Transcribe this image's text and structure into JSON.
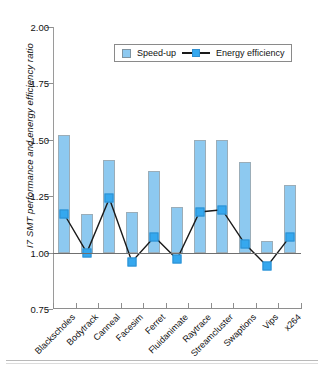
{
  "chart_data": {
    "type": "bar",
    "title": "",
    "xlabel": "",
    "ylabel": "I7 SMT performance and energy efficiency ratio",
    "ylim": [
      0.75,
      2.0
    ],
    "ytick_labels": [
      "2.00",
      "1.75",
      "1.50",
      "1.25",
      "1.00",
      "0.75"
    ],
    "ytick_values": [
      2.0,
      1.75,
      1.5,
      1.25,
      1.0,
      0.75
    ],
    "baseline": 1.0,
    "grid": false,
    "legend_position": "top-center",
    "categories": [
      "Blackscholes",
      "Bodytrack",
      "Canneal",
      "Facesim",
      "Ferret",
      "Fluidanimate",
      "Raytrace",
      "Streamcluster",
      "Swaptions",
      "Vips",
      "x264"
    ],
    "series": [
      {
        "name": "Speed-up",
        "type": "bar",
        "color": "#8dc9f0",
        "values": [
          1.52,
          1.17,
          1.41,
          1.18,
          1.36,
          1.2,
          1.5,
          1.5,
          1.4,
          1.05,
          1.3
        ]
      },
      {
        "name": "Energy efficiency",
        "type": "line",
        "color": "#35a8ef",
        "line_color": "#1a1a1a",
        "values": [
          1.17,
          1.0,
          1.24,
          0.96,
          1.07,
          0.97,
          1.18,
          1.19,
          1.04,
          0.94,
          1.07
        ]
      }
    ]
  },
  "legend": {
    "items": [
      {
        "label": "Speed-up",
        "marker": "bar-swatch"
      },
      {
        "label": "Energy efficiency",
        "marker": "line-square"
      }
    ]
  },
  "colors": {
    "bar_fill": "#8dc9f0",
    "bar_border": "#9badb8",
    "marker_fill": "#35a8ef",
    "line": "#1a1a1a",
    "axis": "#8e8e8e"
  }
}
